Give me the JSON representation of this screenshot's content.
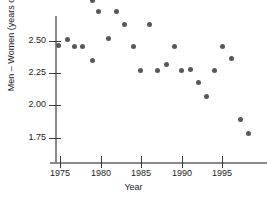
{
  "chart_data": {
    "type": "scatter",
    "title": "",
    "xlabel": "Year",
    "ylabel": "Men – Women (years of age)",
    "xlim": [
      1974,
      1999
    ],
    "ylim": [
      1.68,
      2.98
    ],
    "xticks": [
      1975,
      1980,
      1985,
      1990,
      1995
    ],
    "xtick_labels": [
      "1975",
      "1980",
      "1985",
      "1990",
      "1995"
    ],
    "yticks": [
      2.5,
      2.25,
      2.0,
      1.75
    ],
    "ytick_labels": [
      "2.50",
      "2.25",
      "2.00",
      "1.75"
    ],
    "grid": false,
    "legend": null,
    "marker_color": "#58585a",
    "axis_color": "#8a8a8a",
    "x": [
      1975,
      1976,
      1977,
      1978,
      1979,
      1980,
      1981,
      1982,
      1983,
      1984,
      1985,
      1986,
      1987,
      1988,
      1989,
      1990,
      1991,
      1992,
      1993,
      1994,
      1995,
      1996,
      1997,
      1998
    ],
    "y": [
      2.41,
      2.5,
      2.41,
      2.41,
      2.31,
      2.5,
      2.91,
      2.91,
      2.62,
      2.41,
      2.21,
      2.62,
      2.21,
      2.31,
      2.41,
      2.21,
      2.22,
      2.11,
      2.01,
      2.21,
      2.41,
      2.31,
      1.81,
      1.72
    ],
    "points": [
      {
        "x": 1975,
        "y": 2.41,
        "px": 58,
        "py": 45
      },
      {
        "x": 1976,
        "y": 2.5,
        "px": 67,
        "py": 39
      },
      {
        "x": 1977,
        "y": 2.41,
        "px": 74,
        "py": 46
      },
      {
        "x": 1978,
        "y": 2.41,
        "px": 82,
        "py": 46
      },
      {
        "x": 1979,
        "y": 2.31,
        "px": 92,
        "py": 60
      },
      {
        "x": 1980,
        "y": 2.5,
        "px": 108,
        "py": 38
      },
      {
        "x": 1981,
        "y": 2.91,
        "px": 98,
        "py": 11
      },
      {
        "x": 1982,
        "y": 2.91,
        "px": 116,
        "py": 11
      },
      {
        "x": 1983,
        "y": 2.62,
        "px": 124,
        "py": 24
      },
      {
        "x": 1984,
        "y": 2.41,
        "px": 133,
        "py": 46
      },
      {
        "x": 1985,
        "y": 2.21,
        "px": 140,
        "py": 70
      },
      {
        "x": 1986,
        "y": 2.62,
        "px": 149,
        "py": 24
      },
      {
        "x": 1987,
        "y": 2.21,
        "px": 157,
        "py": 70
      },
      {
        "x": 1988,
        "y": 2.31,
        "px": 166,
        "py": 64
      },
      {
        "x": 1989,
        "y": 2.41,
        "px": 174,
        "py": 46
      },
      {
        "x": 1990,
        "y": 2.21,
        "px": 181,
        "py": 70
      },
      {
        "x": 1991,
        "y": 2.22,
        "px": 190,
        "py": 69
      },
      {
        "x": 1992,
        "y": 2.11,
        "px": 198,
        "py": 82
      },
      {
        "x": 1993,
        "y": 2.01,
        "px": 206,
        "py": 96
      },
      {
        "x": 1994,
        "y": 2.21,
        "px": 214,
        "py": 70
      },
      {
        "x": 1995,
        "y": 2.41,
        "px": 222,
        "py": 46
      },
      {
        "x": 1996,
        "y": 2.31,
        "px": 231,
        "py": 58
      },
      {
        "x": 1997,
        "y": 1.81,
        "px": 240,
        "py": 119
      },
      {
        "x": 1998,
        "y": 1.72,
        "px": 248,
        "py": 133
      },
      {
        "x": 1980,
        "y": 2.97,
        "px": 92,
        "py": 0
      }
    ]
  },
  "axes": {
    "y_ticks": [
      {
        "label": "2.50",
        "py": 41
      },
      {
        "label": "2.25",
        "py": 73
      },
      {
        "label": "2.00",
        "py": 105
      },
      {
        "label": "1.75",
        "py": 138
      }
    ],
    "x_ticks": [
      {
        "label": "1975",
        "px": 60
      },
      {
        "label": "1980",
        "px": 101
      },
      {
        "label": "1985",
        "px": 141
      },
      {
        "label": "1990",
        "px": 182
      },
      {
        "label": "1995",
        "px": 222
      }
    ]
  }
}
